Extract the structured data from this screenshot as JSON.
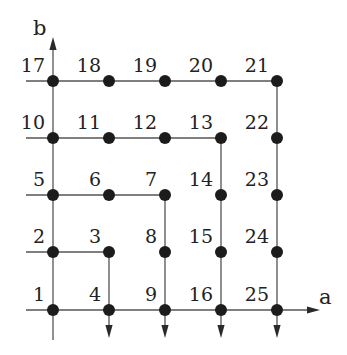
{
  "diagram": {
    "type": "grid-spiral-enumeration",
    "axes": {
      "x": {
        "label": "a",
        "label_pos": [
          319,
          304
        ],
        "arrow_tip": [
          320,
          310
        ]
      },
      "y": {
        "label": "b",
        "label_pos": [
          33,
          35
        ],
        "arrow_tip": [
          53,
          37
        ]
      }
    },
    "columns_x": [
      53,
      109,
      165,
      221,
      277
    ],
    "rows_y": [
      310,
      252,
      195,
      138,
      81
    ],
    "nodes": [
      {
        "id": "1",
        "col": 0,
        "row": 0
      },
      {
        "id": "2",
        "col": 0,
        "row": 1
      },
      {
        "id": "3",
        "col": 1,
        "row": 1
      },
      {
        "id": "4",
        "col": 1,
        "row": 0
      },
      {
        "id": "5",
        "col": 0,
        "row": 2
      },
      {
        "id": "6",
        "col": 1,
        "row": 2
      },
      {
        "id": "7",
        "col": 2,
        "row": 2
      },
      {
        "id": "8",
        "col": 2,
        "row": 1
      },
      {
        "id": "9",
        "col": 2,
        "row": 0
      },
      {
        "id": "10",
        "col": 0,
        "row": 3
      },
      {
        "id": "11",
        "col": 1,
        "row": 3
      },
      {
        "id": "12",
        "col": 2,
        "row": 3
      },
      {
        "id": "13",
        "col": 3,
        "row": 3
      },
      {
        "id": "14",
        "col": 3,
        "row": 2
      },
      {
        "id": "15",
        "col": 3,
        "row": 1
      },
      {
        "id": "16",
        "col": 3,
        "row": 0
      },
      {
        "id": "17",
        "col": 0,
        "row": 4
      },
      {
        "id": "18",
        "col": 1,
        "row": 4
      },
      {
        "id": "19",
        "col": 2,
        "row": 4
      },
      {
        "id": "20",
        "col": 3,
        "row": 4
      },
      {
        "id": "21",
        "col": 4,
        "row": 4
      },
      {
        "id": "22",
        "col": 4,
        "row": 3
      },
      {
        "id": "23",
        "col": 4,
        "row": 2
      },
      {
        "id": "24",
        "col": 4,
        "row": 1
      },
      {
        "id": "25",
        "col": 4,
        "row": 0
      }
    ],
    "paths": [
      {
        "name": "shell-2-4",
        "points": [
          [
            26,
            252
          ],
          [
            109,
            252
          ],
          [
            109,
            338
          ]
        ],
        "arrow_end": true
      },
      {
        "name": "shell-5-9",
        "points": [
          [
            26,
            195
          ],
          [
            165,
            195
          ],
          [
            165,
            338
          ]
        ],
        "arrow_end": true
      },
      {
        "name": "shell-10-16",
        "points": [
          [
            26,
            138
          ],
          [
            221,
            138
          ],
          [
            221,
            338
          ]
        ],
        "arrow_end": true
      },
      {
        "name": "shell-17-25",
        "points": [
          [
            26,
            81
          ],
          [
            277,
            81
          ],
          [
            277,
            338
          ]
        ],
        "arrow_end": true
      }
    ],
    "axis_lines": [
      {
        "name": "a-axis",
        "points": [
          [
            26,
            310
          ],
          [
            320,
            310
          ]
        ],
        "arrow_end": true
      },
      {
        "name": "b-axis",
        "points": [
          [
            53,
            340
          ],
          [
            53,
            37
          ]
        ],
        "arrow_end": true
      }
    ],
    "style": {
      "node_color": "#1c1c1c",
      "edge_color": "#555555",
      "node_radius": 6
    }
  }
}
